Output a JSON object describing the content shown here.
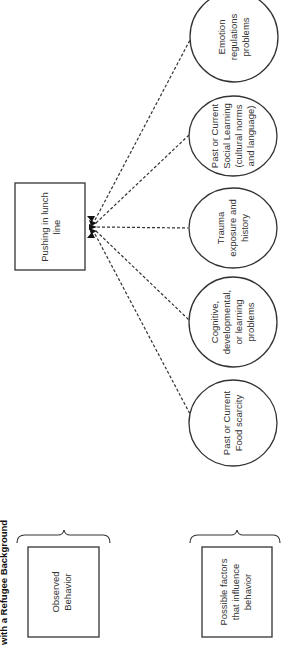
{
  "title": "with a Refugee Background",
  "legend": {
    "observed": {
      "label_lines": [
        "Observed",
        "Behavior"
      ]
    },
    "factors": {
      "label_lines": [
        "Possible factors",
        "that influence",
        "behavior"
      ]
    }
  },
  "behavior": {
    "label_lines": [
      "Pushing in lunch",
      "line"
    ]
  },
  "factors": [
    {
      "id": "emotion",
      "label_lines": [
        "Emotion",
        "regulations",
        "problems"
      ]
    },
    {
      "id": "social",
      "label_lines": [
        "Past or Current",
        "Social Learning",
        "(cultural norms",
        "and language)"
      ]
    },
    {
      "id": "trauma",
      "label_lines": [
        "Trauma",
        "exposure and",
        "history"
      ]
    },
    {
      "id": "cognitive",
      "label_lines": [
        "Cognitive,",
        "developmental,",
        "or learning",
        "problems"
      ]
    },
    {
      "id": "food",
      "label_lines": [
        "Past or Current",
        "Food scarcity"
      ]
    }
  ],
  "colors": {
    "stroke": "#333333",
    "text": "#333333",
    "background": "#ffffff"
  }
}
